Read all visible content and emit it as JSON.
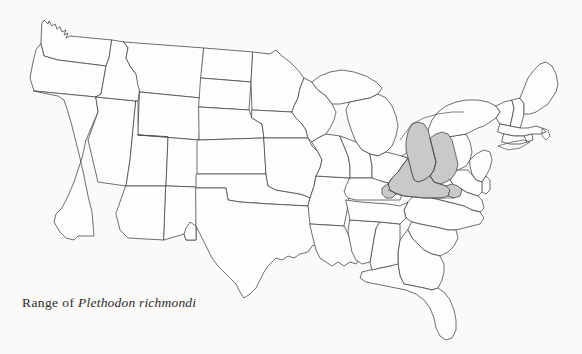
{
  "figure": {
    "type": "distribution-range-map",
    "region": "Continental United States",
    "background_color": "#fbfaf8",
    "outline_color": "#4a4a4a",
    "state_fill_color": "#fdfdfc",
    "range_fill_color": "#c9c9c9"
  },
  "caption": {
    "prefix": "Range of ",
    "species": "Plethodon richmondi",
    "full_text": "Range of Plethodon richmondi"
  },
  "legend": {
    "shaded_meaning": "Shaded area indicates the geographic range of the species",
    "shaded_color": "#c9c9c9"
  },
  "range_states": [
    "Kentucky",
    "West Virginia",
    "Ohio",
    "Virginia",
    "Indiana",
    "Tennessee"
  ],
  "map_states": [
    "Washington",
    "Oregon",
    "California",
    "Nevada",
    "Idaho",
    "Montana",
    "Wyoming",
    "Utah",
    "Arizona",
    "Colorado",
    "New Mexico",
    "North Dakota",
    "South Dakota",
    "Nebraska",
    "Kansas",
    "Oklahoma",
    "Texas",
    "Minnesota",
    "Iowa",
    "Missouri",
    "Arkansas",
    "Louisiana",
    "Wisconsin",
    "Illinois",
    "Michigan",
    "Indiana",
    "Ohio",
    "Kentucky",
    "Tennessee",
    "Mississippi",
    "Alabama",
    "Georgia",
    "Florida",
    "South Carolina",
    "North Carolina",
    "Virginia",
    "West Virginia",
    "Maryland",
    "Delaware",
    "Pennsylvania",
    "New Jersey",
    "New York",
    "Connecticut",
    "Rhode Island",
    "Massachusetts",
    "Vermont",
    "New Hampshire",
    "Maine"
  ]
}
